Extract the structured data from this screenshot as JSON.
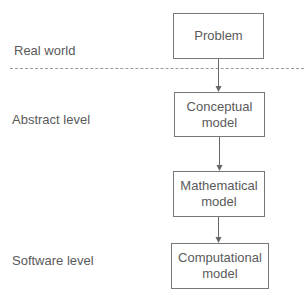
{
  "diagram": {
    "levels": [
      {
        "label": "Real world"
      },
      {
        "label": "Abstract level"
      },
      {
        "label": "Software level"
      }
    ],
    "nodes": [
      {
        "line1": "Problem",
        "line2": ""
      },
      {
        "line1": "Conceptual",
        "line2": "model"
      },
      {
        "line1": "Mathematical",
        "line2": "model"
      },
      {
        "line1": "Computational",
        "line2": "model"
      }
    ],
    "edges": [
      {
        "from": "Problem",
        "to": "Conceptual model"
      },
      {
        "from": "Conceptual model",
        "to": "Mathematical model"
      },
      {
        "from": "Mathematical model",
        "to": "Computational model"
      }
    ],
    "colors": {
      "stroke": "#777777",
      "text": "#5a5a5a",
      "divider": "#9a9a9a"
    }
  }
}
